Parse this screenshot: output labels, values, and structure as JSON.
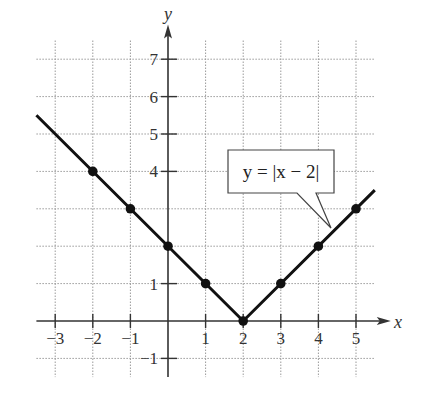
{
  "chart_data": {
    "type": "line",
    "title": "",
    "equation_label": "y = |x − 2|",
    "xlabel": "x",
    "ylabel": "y",
    "xlim": [
      -3.5,
      5.5
    ],
    "ylim": [
      -1.5,
      7.5
    ],
    "grid": true,
    "x_ticks": [
      -3,
      -2,
      -1,
      1,
      2,
      3,
      4,
      5
    ],
    "x_tick_labels": [
      "−3",
      "−2",
      "−1",
      "1",
      "2",
      "3",
      "4",
      "5"
    ],
    "y_ticks": [
      -1,
      1,
      4,
      5,
      6,
      7
    ],
    "y_tick_labels": [
      "−1",
      "1",
      "4",
      "5",
      "6",
      "7"
    ],
    "series": [
      {
        "name": "y = |x − 2|",
        "line_x": [
          -3.5,
          2,
          5.5
        ],
        "line_y": [
          5.5,
          0,
          3.5
        ],
        "points_x": [
          -2,
          -1,
          0,
          1,
          2,
          3,
          4,
          5
        ],
        "points_y": [
          4,
          3,
          2,
          1,
          0,
          1,
          2,
          3
        ]
      }
    ]
  },
  "colors": {
    "line": "#111111",
    "axis": "#333333",
    "grid": "#9a9a9a",
    "text": "#333333"
  }
}
